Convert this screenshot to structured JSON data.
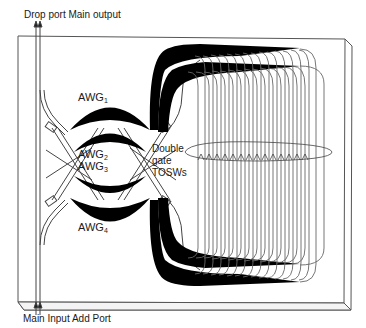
{
  "diagram": {
    "type": "planar-lightwave-circuit",
    "labels": {
      "top_ports": "Drop port Main output",
      "bottom_ports": "Main Input Add Port",
      "awg1": {
        "base": "AWG",
        "sub": "1"
      },
      "awg2": {
        "base": "AWG",
        "sub": "2"
      },
      "awg3": {
        "base": "AWG",
        "sub": "3"
      },
      "awg4": {
        "base": "AWG",
        "sub": "4"
      },
      "tosw_line1": "Double",
      "tosw_line2": "gate",
      "tosw_line3": "TOSWs"
    },
    "components": [
      {
        "id": "chip-substrate",
        "shape": "3d-slab"
      },
      {
        "id": "awg-1",
        "position": "top"
      },
      {
        "id": "awg-2",
        "position": "upper-middle"
      },
      {
        "id": "awg-3",
        "position": "lower-middle"
      },
      {
        "id": "awg-4",
        "position": "bottom"
      },
      {
        "id": "waveguide-loop-array",
        "count": 16
      },
      {
        "id": "tosw-ellipse-marker"
      }
    ],
    "colors": {
      "line": "#555555",
      "fill": "#000000",
      "background": "#ffffff"
    }
  }
}
